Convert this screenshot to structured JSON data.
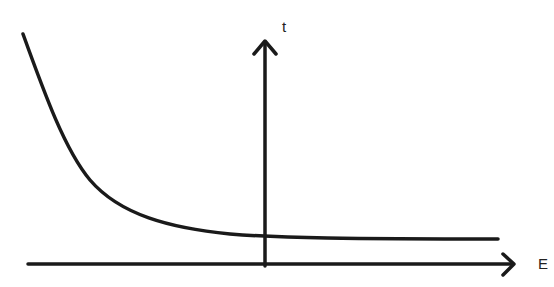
{
  "diagram": {
    "axes": {
      "x_label": "E",
      "y_label": "t"
    },
    "curve": {
      "description": "Decreasing curve approaching a horizontal asymptote above the E axis",
      "color": "#1a1a1a"
    },
    "stroke_color": "#1a1a1a"
  }
}
